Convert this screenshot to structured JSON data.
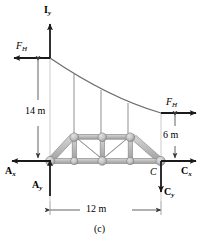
{
  "figure": {
    "caption": "(c)",
    "type": "free-body-diagram"
  },
  "colors": {
    "stroke": "#1a1a1a",
    "truss_fill": "#bdbdbd",
    "truss_edge": "#8c8c8c",
    "cable": "#6e6e6e",
    "hanger": "#9a9a9a",
    "reference_line": "#b5b5b5",
    "dimension_line": "#3a3a3a",
    "background": "#ffffff"
  },
  "forces": [
    {
      "id": "Iy",
      "symbol": "I",
      "subscript": "y",
      "bold": true,
      "direction": "up",
      "location": "top-left-tower"
    },
    {
      "id": "FH-left",
      "symbol": "F",
      "subscript": "H",
      "bold": false,
      "italic": true,
      "direction": "left",
      "location": "upper-left"
    },
    {
      "id": "FH-right",
      "symbol": "F",
      "subscript": "H",
      "bold": false,
      "italic": true,
      "direction": "right",
      "location": "mid-right"
    },
    {
      "id": "Ax",
      "symbol": "A",
      "subscript": "x",
      "bold": true,
      "direction": "left",
      "location": "bottom-left"
    },
    {
      "id": "Ay",
      "symbol": "A",
      "subscript": "y",
      "bold": true,
      "direction": "up",
      "location": "bottom-left"
    },
    {
      "id": "Cx",
      "symbol": "C",
      "subscript": "x",
      "bold": true,
      "direction": "right",
      "location": "bottom-right"
    },
    {
      "id": "Cy",
      "symbol": "C",
      "subscript": "y",
      "bold": true,
      "direction": "down",
      "location": "bottom-right"
    }
  ],
  "point_labels": [
    {
      "id": "C",
      "text": "C",
      "italic": true
    }
  ],
  "dimensions": [
    {
      "id": "height-left",
      "value": "14",
      "unit": "m",
      "text": "14 m",
      "orientation": "vertical"
    },
    {
      "id": "height-right",
      "value": "6",
      "unit": "m",
      "text": "6 m",
      "orientation": "vertical"
    },
    {
      "id": "span",
      "value": "12",
      "unit": "m",
      "text": "12 m",
      "orientation": "horizontal"
    }
  ],
  "labels": {
    "Iy_main": "I",
    "Iy_sub": "y",
    "FH_main": "F",
    "FH_sub": "H",
    "Ax_main": "A",
    "Ax_sub": "x",
    "Ay_main": "A",
    "Ay_sub": "y",
    "Cx_main": "C",
    "Cx_sub": "x",
    "Cy_main": "C",
    "Cy_sub": "y",
    "C_point": "C",
    "dim_14": "14 m",
    "dim_6": "6 m",
    "dim_12": "12 m",
    "caption": "(c)"
  }
}
